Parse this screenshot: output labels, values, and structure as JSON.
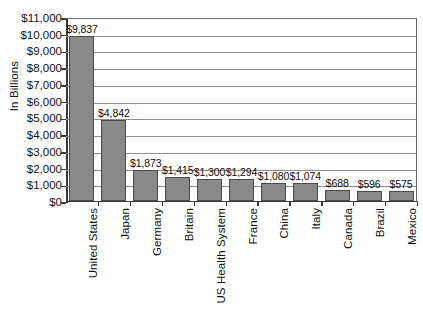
{
  "chart_data": {
    "type": "bar",
    "title": "",
    "xlabel": "",
    "ylabel": "In Billions",
    "ylim": [
      0,
      11000
    ],
    "ytick_step": 1000,
    "grid": true,
    "legend": false,
    "bar_color": "#8a8a8a",
    "bar_border_color": "#4a4a4a",
    "categories": [
      "United States",
      "Japan",
      "Germany",
      "Britain",
      "US Health System",
      "France",
      "China",
      "Italy",
      "Canada",
      "Brazil",
      "Mexico"
    ],
    "values": [
      9837,
      4842,
      1873,
      1415,
      1300,
      1294,
      1080,
      1074,
      688,
      596,
      575
    ],
    "value_labels": [
      "$9,837",
      "$4,842",
      "$1,873",
      "$1,415",
      "$1,300",
      "$1,294",
      "$1,080",
      "$1,074",
      "$688",
      "$596",
      "$575"
    ],
    "ytick_labels": [
      "$11,000",
      "$10,000",
      "$9,000",
      "$8,000",
      "$7,000",
      "$6,000",
      "$5,000",
      "$4,000",
      "$3,000",
      "$2,000",
      "$1,000",
      "$0"
    ],
    "ytick_values": [
      11000,
      10000,
      9000,
      8000,
      7000,
      6000,
      5000,
      4000,
      3000,
      2000,
      1000,
      0
    ]
  }
}
